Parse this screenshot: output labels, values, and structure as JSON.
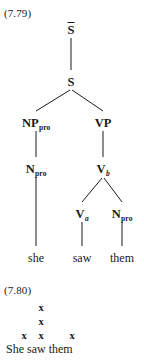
{
  "figure_779": {
    "number": "(7.79)",
    "type": "syntactic-tree",
    "nodes": {
      "s_bar": {
        "label": "S",
        "overbar": true
      },
      "s": {
        "label": "S"
      },
      "np_pro": {
        "label": "NP",
        "subscript": "pro"
      },
      "vp": {
        "label": "VP"
      },
      "n_pro_left": {
        "label": "N",
        "subscript": "pro"
      },
      "v_b": {
        "label": "V",
        "subscript": "b"
      },
      "v_a": {
        "label": "V",
        "subscript": "a"
      },
      "n_pro_right": {
        "label": "N",
        "subscript": "pro"
      }
    },
    "leaves": {
      "she": "she",
      "saw": "saw",
      "them": "them"
    }
  },
  "figure_780": {
    "number": "(7.80)",
    "type": "metrical-grid",
    "columns": [
      {
        "word": "She",
        "marks": 1
      },
      {
        "word": "saw",
        "marks": 3
      },
      {
        "word": "them",
        "marks": 1
      }
    ],
    "mark_symbol": "x",
    "sentence": "She saw them"
  },
  "colors": {
    "ink": "#1a1a1a",
    "background": "#ffffff"
  }
}
